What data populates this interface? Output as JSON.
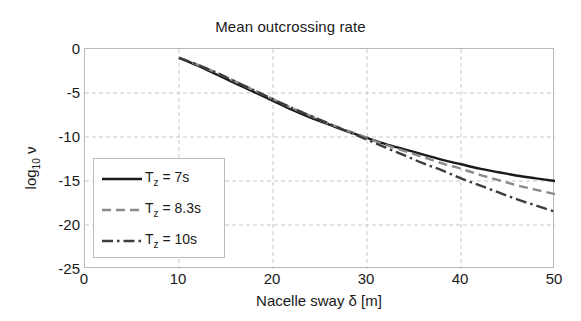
{
  "chart_data": {
    "type": "line",
    "title": "Mean outcrossing rate",
    "xlabel": "Nacelle sway δ [m]",
    "ylabel": "log10 ν",
    "xlim": [
      0,
      50
    ],
    "ylim": [
      -25,
      0
    ],
    "grid": true,
    "legend_position": "lower left",
    "xticks": [
      0,
      10,
      20,
      30,
      40,
      50
    ],
    "xtick_labels": [
      "0",
      "10",
      "20",
      "30",
      "40",
      "50"
    ],
    "yticks": [
      0,
      -5,
      -10,
      -15,
      -20,
      -25
    ],
    "ytick_labels": [
      "0",
      "-5",
      "-10",
      "-15",
      "-20",
      "-25"
    ],
    "x": [
      10,
      12,
      14,
      16,
      18,
      20,
      22,
      24,
      26,
      28,
      30,
      32,
      34,
      36,
      38,
      40,
      42,
      44,
      46,
      48,
      50
    ],
    "series": [
      {
        "name": "Tz = 7s",
        "label_main": "T",
        "label_sub": "z",
        "label_rest": " = 7s",
        "style": "solid",
        "color": "#1a1a1a",
        "values": [
          -1.0,
          -1.9,
          -2.9,
          -3.9,
          -4.9,
          -5.9,
          -6.9,
          -7.8,
          -8.6,
          -9.4,
          -10.1,
          -10.8,
          -11.4,
          -12.0,
          -12.6,
          -13.1,
          -13.6,
          -14.0,
          -14.4,
          -14.7,
          -15.0
        ]
      },
      {
        "name": "Tz = 8.3s",
        "label_main": "T",
        "label_sub": "z",
        "label_rest": " = 8.3s",
        "style": "dashed",
        "color": "#8a8a8a",
        "values": [
          -1.0,
          -1.8,
          -2.7,
          -3.7,
          -4.7,
          -5.7,
          -6.7,
          -7.6,
          -8.5,
          -9.3,
          -10.1,
          -10.9,
          -11.6,
          -12.3,
          -13.0,
          -13.6,
          -14.3,
          -14.9,
          -15.5,
          -16.0,
          -16.5
        ]
      },
      {
        "name": "Tz = 10s",
        "label_main": "T",
        "label_sub": "z",
        "label_rest": " = 10s",
        "style": "dashdot",
        "color": "#3d3d3d",
        "values": [
          -1.0,
          -1.8,
          -2.7,
          -3.7,
          -4.7,
          -5.7,
          -6.7,
          -7.6,
          -8.5,
          -9.4,
          -10.3,
          -11.2,
          -12.1,
          -13.0,
          -13.8,
          -14.7,
          -15.5,
          -16.3,
          -17.1,
          -17.8,
          -18.5
        ]
      }
    ]
  },
  "axis": {
    "grid_color": "#c8c8c8",
    "frame_color": "#b9b9b9"
  }
}
